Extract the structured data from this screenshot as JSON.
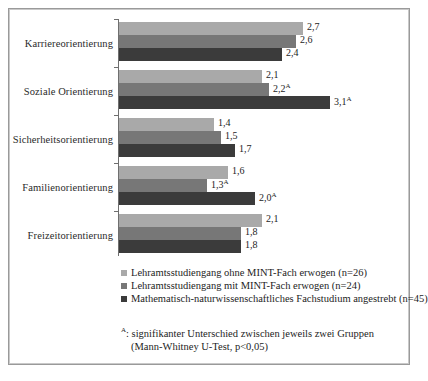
{
  "chart_data": {
    "type": "bar",
    "orientation": "horizontal",
    "title": "",
    "xlabel": "",
    "ylabel": "",
    "xlim": [
      0,
      3.4
    ],
    "grid": false,
    "legend_position": "bottom",
    "categories": [
      "Karriereorientierung",
      "Soziale Orientierung",
      "Sicherheitsorientierung",
      "Familienorientierung",
      "Freizeitorientierung"
    ],
    "series": [
      {
        "name": "Lehramtsstudiengang ohne MINT-Fach erwogen (n=26)",
        "color": "#a9a9a9",
        "values": [
          2.7,
          2.1,
          1.4,
          1.6,
          2.1
        ],
        "labels": [
          "2,7",
          "2,1",
          "1,4",
          "1,6",
          "2,1"
        ],
        "marks": [
          "",
          "",
          "",
          "",
          ""
        ]
      },
      {
        "name": "Lehramtsstudiengang mit MINT-Fach erwogen (n=24)",
        "color": "#777777",
        "values": [
          2.6,
          2.2,
          1.5,
          1.3,
          1.8
        ],
        "labels": [
          "2,6",
          "2,2",
          "1,5",
          "1,3",
          "1,8"
        ],
        "marks": [
          "",
          "A",
          "",
          "A",
          ""
        ]
      },
      {
        "name": "Mathematisch-naturwissenschaftliches Fachstudium angestrebt (n=45)",
        "color": "#3b3b3b",
        "values": [
          2.4,
          3.1,
          1.7,
          2.0,
          1.8
        ],
        "labels": [
          "2,4",
          "3,1",
          "1,7",
          "2,0",
          "1,8"
        ],
        "marks": [
          "",
          "A",
          "",
          "A",
          ""
        ]
      }
    ]
  },
  "legend": {
    "items": [
      {
        "label": "Lehramtsstudiengang ohne MINT-Fach erwogen (n=26)",
        "color": "#a9a9a9"
      },
      {
        "label": "Lehramtsstudiengang mit MINT-Fach erwogen (n=24)",
        "color": "#777777"
      },
      {
        "label": "Mathematisch-naturwissenschaftliches Fachstudium angestrebt (n=45)",
        "color": "#3b3b3b"
      }
    ]
  },
  "footnote": {
    "marker": "A",
    "line1": ": signifikanter Unterschied zwischen jeweils zwei Gruppen",
    "line2": "(Mann-Whitney U-Test, p<0,05)"
  },
  "caption": {
    "text": ""
  }
}
